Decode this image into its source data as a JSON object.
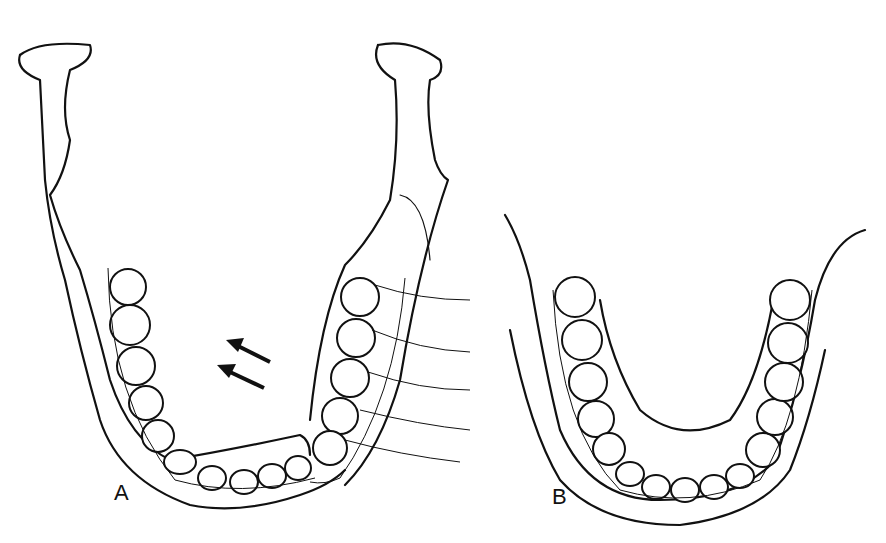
{
  "figure": {
    "panels": [
      {
        "label": "A",
        "description": "Mandible with left segment displaced, ligature wires and arch bar; arrows indicate direction of reduction"
      },
      {
        "label": "B",
        "description": "Mandible after reduction with arch bars in place"
      }
    ],
    "annotations": {
      "arrows": 2,
      "arrow_direction": "up-left"
    }
  }
}
